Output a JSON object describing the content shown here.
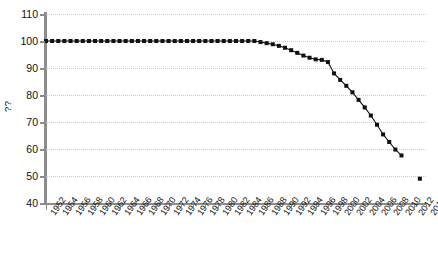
{
  "chart_data": {
    "type": "line",
    "title": "",
    "subtitle": "",
    "xlabel": "",
    "ylabel": "??",
    "ylim": [
      40,
      110
    ],
    "xlim": [
      1952,
      2014
    ],
    "y_ticks": [
      110,
      100,
      90,
      80,
      70,
      60,
      50,
      40
    ],
    "x_ticks": [
      1952,
      1954,
      1956,
      1958,
      1960,
      1962,
      1964,
      1966,
      1968,
      1970,
      1972,
      1974,
      1976,
      1978,
      1980,
      1982,
      1984,
      1986,
      1988,
      1990,
      1992,
      1994,
      1996,
      1998,
      2000,
      2002,
      2004,
      2006,
      2008,
      2010,
      2012,
      2014
    ],
    "grid": true,
    "grid_axis": "y",
    "legend": "none",
    "marker": "square",
    "marker_color": "#111111",
    "line_color": "#111111",
    "x": [
      1952,
      1953,
      1954,
      1955,
      1956,
      1957,
      1958,
      1959,
      1960,
      1961,
      1962,
      1963,
      1964,
      1965,
      1966,
      1967,
      1968,
      1969,
      1970,
      1971,
      1972,
      1973,
      1974,
      1975,
      1976,
      1977,
      1978,
      1979,
      1980,
      1981,
      1982,
      1983,
      1984,
      1985,
      1986,
      1987,
      1988,
      1989,
      1990,
      1991,
      1992,
      1993,
      1994,
      1995,
      1996,
      1997,
      1998,
      1999,
      2000,
      2001,
      2002,
      2003,
      2004,
      2005,
      2006,
      2007,
      2008,
      2009,
      2010,
      2013
    ],
    "values": [
      100,
      100,
      100,
      100,
      100,
      100,
      100,
      100,
      100,
      100,
      100,
      100,
      100,
      100,
      100,
      100,
      100,
      100,
      100,
      100,
      100,
      100,
      100,
      100,
      100,
      100,
      100,
      100,
      100,
      100,
      100,
      100,
      100,
      100,
      100,
      99.6,
      99.2,
      98.8,
      98.2,
      97.5,
      96.6,
      95.6,
      94.6,
      93.8,
      93.2,
      93.0,
      92.2,
      88.0,
      85.6,
      83.4,
      81.0,
      78.2,
      75.4,
      72.4,
      69.0,
      65.4,
      62.6,
      59.8,
      57.6,
      49.0
    ],
    "series_breaks": [
      [
        0,
        58
      ],
      [
        59,
        59
      ]
    ]
  }
}
